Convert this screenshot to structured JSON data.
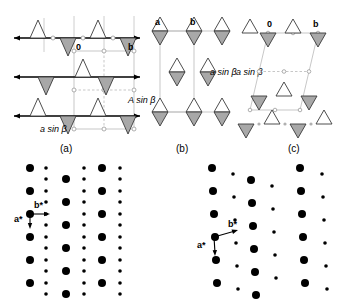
{
  "figure": {
    "title_visible": false,
    "panels": [
      {
        "id": "a",
        "caption": "(a)",
        "labels": {
          "origin": "0",
          "b_axis": "b",
          "spacing": "a sin β",
          "spacing_italic_prefix": "a",
          "spacing_rest": "sin β"
        },
        "description": "Three horizontal rows of alternating up and down triangles on solid lines with rectangular unit cell overlay",
        "rows": 3,
        "motif": "triangle",
        "cell_type": "rectangular"
      },
      {
        "id": "b",
        "caption": "(b)",
        "labels": {
          "a_axis": "a",
          "b_axis": "b",
          "spacing_h": "a sin β",
          "spacing_v": "A sin β"
        },
        "description": "Columns of diamond motifs formed by fused up and down triangles with rectangular unit cell",
        "rows": 3,
        "motif": "diamond",
        "cell_type": "rectangular"
      },
      {
        "id": "c",
        "caption": "(c)",
        "labels": {
          "origin": "0",
          "b_axis": "b",
          "spacing": "a sin β"
        },
        "description": "Oblique parallelogram unit cell over alternating up and down triangles",
        "rows": 3,
        "motif": "triangle",
        "cell_type": "oblique"
      }
    ],
    "diffraction": [
      {
        "id": "left",
        "belongs_to": "(a)",
        "lattice": "rectangular",
        "vectors": {
          "a_star": "a*",
          "b_star": "b*"
        },
        "spot_sizes": [
          "large",
          "small"
        ],
        "columns": 6
      },
      {
        "id": "right",
        "belongs_to": "(c)",
        "lattice": "oblique",
        "vectors": {
          "a_star": "a*",
          "b_star": "b*"
        },
        "spot_sizes": [
          "large",
          "small"
        ],
        "columns": 6
      }
    ],
    "colors": {
      "triangle_up_fill": "#ffffff",
      "triangle_down_fill": "#a8a8a8",
      "outline": "#3a3a3a",
      "row_line": "#000000",
      "cell_line": "#b9b9b9",
      "spot": "#000000",
      "background": "#ffffff"
    }
  }
}
